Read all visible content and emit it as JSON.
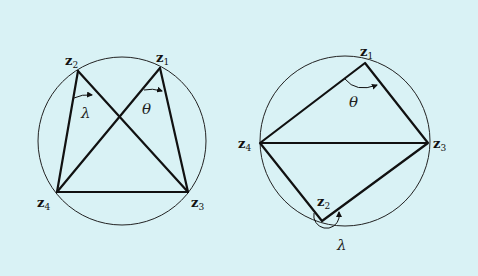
{
  "background": "#d9f2f5",
  "stroke_color": "#111111",
  "diagrams": [
    {
      "name": "crossed-quadrilateral",
      "circle": {
        "cx": 122,
        "cy": 141,
        "r": 84
      },
      "points": {
        "z1": {
          "label": "z",
          "sub": "1",
          "x": 160,
          "y": 68
        },
        "z2": {
          "label": "z",
          "sub": "2",
          "x": 78,
          "y": 71
        },
        "z3": {
          "label": "z",
          "sub": "3",
          "x": 188,
          "y": 192
        },
        "z4": {
          "label": "z",
          "sub": "4",
          "x": 57,
          "y": 192
        }
      },
      "angles": {
        "lambda": "λ",
        "theta": "θ"
      }
    },
    {
      "name": "cyclic-quadrilateral",
      "circle": {
        "cx": 345,
        "cy": 141,
        "r": 85
      },
      "points": {
        "z1": {
          "label": "z",
          "sub": "1",
          "x": 365,
          "y": 63
        },
        "z2": {
          "label": "z",
          "sub": "2",
          "x": 322,
          "y": 221
        },
        "z3": {
          "label": "z",
          "sub": "3",
          "x": 428,
          "y": 143
        },
        "z4": {
          "label": "z",
          "sub": "4",
          "x": 260,
          "y": 143
        }
      },
      "angles": {
        "lambda": "λ",
        "theta": "θ"
      }
    }
  ]
}
